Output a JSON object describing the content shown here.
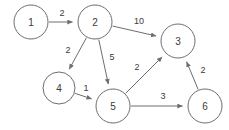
{
  "diagram": {
    "type": "directed-weighted-graph",
    "colors": {
      "background": "#ffffff",
      "stroke": "#6e6e6e",
      "text": "#3a3a3a"
    },
    "nodes": [
      {
        "id": "1",
        "label": "1",
        "cx": 31,
        "cy": 22,
        "r": 17
      },
      {
        "id": "2",
        "label": "2",
        "cx": 95,
        "cy": 22,
        "r": 17
      },
      {
        "id": "3",
        "label": "3",
        "cx": 178,
        "cy": 41,
        "r": 17
      },
      {
        "id": "4",
        "label": "4",
        "cx": 59,
        "cy": 88,
        "r": 16
      },
      {
        "id": "5",
        "label": "5",
        "cx": 113,
        "cy": 106,
        "r": 17
      },
      {
        "id": "6",
        "label": "6",
        "cx": 205,
        "cy": 106,
        "r": 17
      }
    ],
    "edges": [
      {
        "id": "e1",
        "from": "1",
        "to": "2",
        "weight": "2",
        "lx": 62,
        "ly": 13
      },
      {
        "id": "e2",
        "from": "2",
        "to": "3",
        "weight": "10",
        "lx": 139,
        "ly": 21
      },
      {
        "id": "e3",
        "from": "2",
        "to": "4",
        "weight": "2",
        "lx": 68,
        "ly": 50
      },
      {
        "id": "e4",
        "from": "2",
        "to": "5",
        "weight": "5",
        "lx": 112,
        "ly": 57
      },
      {
        "id": "e5",
        "from": "4",
        "to": "5",
        "weight": "1",
        "lx": 86,
        "ly": 88
      },
      {
        "id": "e6",
        "from": "5",
        "to": "3",
        "weight": "2",
        "lx": 137,
        "ly": 67
      },
      {
        "id": "e7",
        "from": "5",
        "to": "6",
        "weight": "3",
        "lx": 163,
        "ly": 96
      },
      {
        "id": "e8",
        "from": "6",
        "to": "3",
        "weight": "2",
        "lx": 203,
        "ly": 70
      }
    ]
  }
}
